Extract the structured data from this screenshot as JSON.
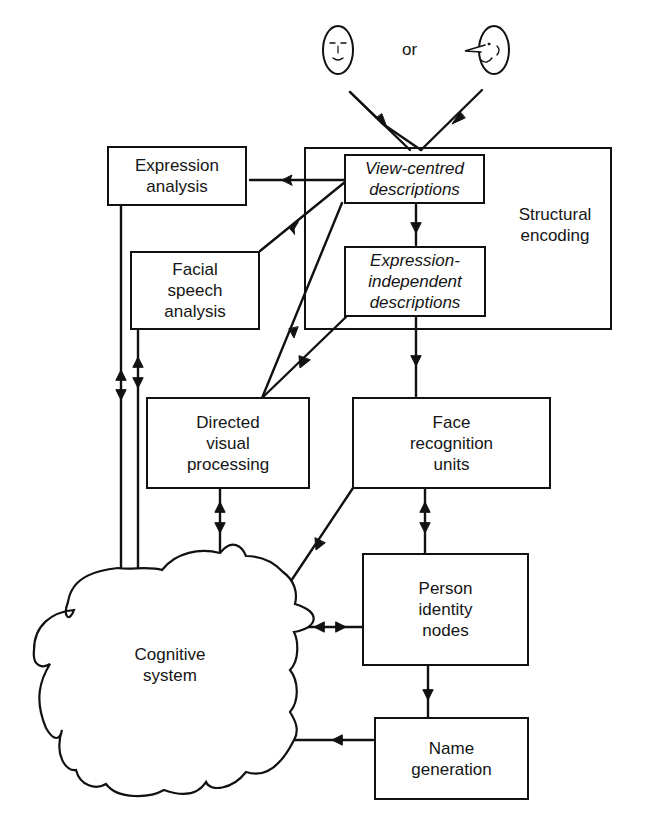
{
  "diagram": {
    "input": {
      "or_label": "or",
      "faces": [
        "front-view face",
        "profile-view face"
      ]
    },
    "group": {
      "label": "Structural\nencoding"
    },
    "nodes": {
      "view_centred": "View-centred\ndescriptions",
      "expr_indep": "Expression-\nindependent\ndescriptions",
      "expression_analysis": "Expression\nanalysis",
      "facial_speech": "Facial\nspeech\nanalysis",
      "directed_visual": "Directed\nvisual\nprocessing",
      "fru": "Face\nrecognition\nunits",
      "pin": "Person\nidentity\nnodes",
      "name_gen": "Name\ngeneration",
      "cognitive": "Cognitive\nsystem"
    },
    "edges": [
      {
        "from": "face-inputs",
        "to": "view-centred-descriptions",
        "type": "arrow"
      },
      {
        "from": "view-centred-descriptions",
        "to": "expression-analysis",
        "type": "arrow"
      },
      {
        "from": "view-centred-descriptions",
        "to": "facial-speech-analysis",
        "type": "arrow"
      },
      {
        "from": "view-centred-descriptions",
        "to": "directed-visual-processing",
        "type": "arrow"
      },
      {
        "from": "view-centred-descriptions",
        "to": "expression-independent-descriptions",
        "type": "arrow"
      },
      {
        "from": "expression-independent-descriptions",
        "to": "directed-visual-processing",
        "type": "arrow"
      },
      {
        "from": "expression-independent-descriptions",
        "to": "face-recognition-units",
        "type": "arrow"
      },
      {
        "from": "expression-analysis",
        "to": "cognitive-system",
        "type": "bidirectional"
      },
      {
        "from": "facial-speech-analysis",
        "to": "cognitive-system",
        "type": "bidirectional"
      },
      {
        "from": "directed-visual-processing",
        "to": "cognitive-system",
        "type": "bidirectional"
      },
      {
        "from": "face-recognition-units",
        "to": "cognitive-system",
        "type": "arrow"
      },
      {
        "from": "face-recognition-units",
        "to": "person-identity-nodes",
        "type": "bidirectional"
      },
      {
        "from": "person-identity-nodes",
        "to": "cognitive-system",
        "type": "bidirectional"
      },
      {
        "from": "person-identity-nodes",
        "to": "name-generation",
        "type": "arrow"
      },
      {
        "from": "name-generation",
        "to": "cognitive-system",
        "type": "arrow"
      }
    ]
  }
}
